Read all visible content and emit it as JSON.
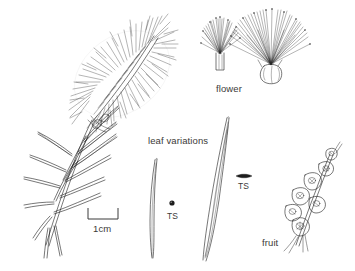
{
  "figure": {
    "type": "botanical-line-drawing",
    "background_color": "#ffffff",
    "ink_color": "#1d1d1d",
    "text_color": "#3c3a38"
  },
  "labels": {
    "flower": "flower",
    "leaf_variations": "leaf variations",
    "fruit": "fruit",
    "ts_narrow_leaf": "TS",
    "ts_broad_leaf": "TS",
    "scale": "1cm"
  },
  "parts": [
    {
      "name": "flowering-branch",
      "description": "leafy stem bearing a dense cylindrical bottlebrush inflorescence",
      "label": null
    },
    {
      "name": "single-flower-narrow",
      "description": "individual flower with narrow tubular base and brush of stamens",
      "label": "flower"
    },
    {
      "name": "single-flower-broad",
      "description": "individual flower with bulbous base and spreading stamens",
      "label": "flower"
    },
    {
      "name": "leaf-narrow",
      "description": "narrow curved terete leaf",
      "label": "leaf variations"
    },
    {
      "name": "leaf-broad",
      "description": "longer flat leaf with longitudinal veins",
      "label": "leaf variations"
    },
    {
      "name": "ts-narrow",
      "description": "transverse section of narrow leaf, round in outline",
      "label": "TS"
    },
    {
      "name": "ts-broad",
      "description": "transverse section of broad leaf, flattened lens outline",
      "label": "TS"
    },
    {
      "name": "fruit-cluster",
      "description": "woody capsules clustered along a stem segment",
      "label": "fruit"
    },
    {
      "name": "scale-bar",
      "description": "bracket-style scale bar",
      "label": "1cm"
    }
  ],
  "scale_bar": {
    "length_label": "1cm",
    "style": "bracket"
  }
}
